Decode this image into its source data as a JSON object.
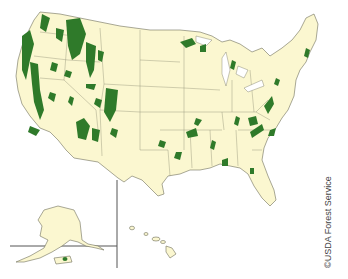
{
  "map": {
    "subject": "National Forests of the United States",
    "regions": [
      "Contiguous United States",
      "Alaska",
      "Hawaii",
      "Puerto Rico"
    ],
    "colors": {
      "land": "#fbf7d0",
      "forest": "#2f7a2a",
      "water": "#ffffff",
      "borders": "#6f6f5a"
    }
  },
  "credit": "©USDA Forest Service"
}
